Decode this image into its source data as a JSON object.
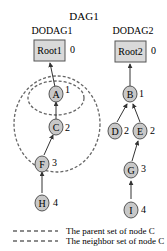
{
  "diagram": {
    "title": "DAG1",
    "colors": {
      "node_fill": "#c8c8c8",
      "node_stroke": "#555555",
      "root_fill": "#d9d9d9",
      "edge": "#333333",
      "dashed": "#555555"
    },
    "dodags": [
      {
        "label": "DODAG1",
        "root": {
          "label": "Root1",
          "rank": "0"
        },
        "nodes": [
          {
            "id": "A",
            "rank": "1",
            "parent": "Root1"
          },
          {
            "id": "C",
            "rank": "2",
            "parent": "A"
          },
          {
            "id": "F",
            "rank": "3",
            "parent": "C"
          },
          {
            "id": "H",
            "rank": "4",
            "parent": "F"
          }
        ]
      },
      {
        "label": "DODAG2",
        "root": {
          "label": "Root2",
          "rank": "0"
        },
        "nodes": [
          {
            "id": "B",
            "rank": "1",
            "parent": "Root2"
          },
          {
            "id": "D",
            "rank": "2",
            "parent": "B"
          },
          {
            "id": "E",
            "rank": "2",
            "parent": "B"
          },
          {
            "id": "G",
            "rank": "3",
            "parent": "E"
          },
          {
            "id": "I",
            "rank": "4",
            "parent": "G"
          }
        ]
      }
    ],
    "legend": [
      {
        "style": "dashed",
        "label": "The parent set of node C"
      },
      {
        "style": "dashed",
        "label": "The neighbor set of node C"
      }
    ]
  }
}
